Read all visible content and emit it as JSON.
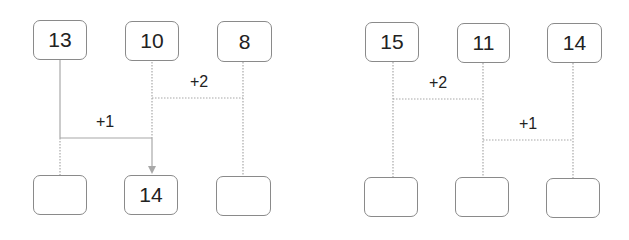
{
  "diagrams": [
    {
      "top_boxes": [
        "13",
        "10",
        "8"
      ],
      "bottom_boxes": [
        "",
        "14",
        ""
      ],
      "labels": [
        "+2",
        "+1"
      ]
    },
    {
      "top_boxes": [
        "15",
        "11",
        "14"
      ],
      "bottom_boxes": [
        "",
        "",
        ""
      ],
      "labels": [
        "+2",
        "+1"
      ]
    }
  ],
  "colors": {
    "line": "#a0a0a0",
    "border": "#8a8a8a",
    "text": "#222222"
  }
}
